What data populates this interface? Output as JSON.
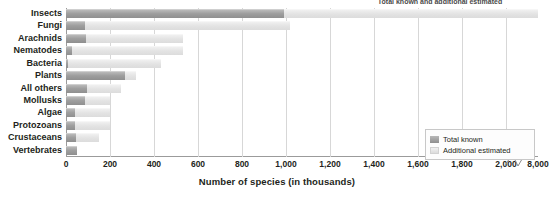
{
  "chart_data": {
    "type": "bar",
    "orientation": "horizontal",
    "stacked": true,
    "title": "Total known and additional estimated",
    "xlabel": "Number of species (in thousands)",
    "ylabel": "",
    "categories": [
      "Insects",
      "Fungi",
      "Arachnids",
      "Nematodes",
      "Bacteria",
      "Plants",
      "All others",
      "Mollusks",
      "Algae",
      "Protozoans",
      "Crustaceans",
      "Vertebrates"
    ],
    "series": [
      {
        "name": "Total known",
        "color": "#9e9e9e",
        "values": [
          990,
          85,
          90,
          25,
          10,
          270,
          95,
          85,
          40,
          40,
          45,
          50
        ]
      },
      {
        "name": "Additional estimated",
        "color": "#e3e3e3",
        "values": [
          7010,
          935,
          440,
          505,
          420,
          50,
          155,
          115,
          160,
          160,
          105,
          0
        ]
      }
    ],
    "totals": [
      8000,
      1020,
      530,
      530,
      430,
      320,
      250,
      200,
      200,
      200,
      150,
      50
    ],
    "xticks": [
      "0",
      "200",
      "400",
      "600",
      "800",
      "1,000",
      "1,200",
      "1,400",
      "1,600",
      "1,800",
      "2,000",
      "8,000"
    ],
    "xtick_values": [
      0,
      200,
      400,
      600,
      800,
      1000,
      1200,
      1400,
      1600,
      1800,
      2000,
      8000
    ],
    "xlim": [
      0,
      2000
    ],
    "axis_break": {
      "present": true,
      "after": 2000,
      "resumes_at": 8000
    },
    "grid": "vertical",
    "legend_position": "bottom-right",
    "legend_entries": [
      "Total known",
      "Additional estimated"
    ]
  },
  "legend": {
    "known_label": "Total known",
    "estimated_label": "Additional estimated"
  },
  "axis": {
    "x_title": "Number of species (in thousands)"
  }
}
